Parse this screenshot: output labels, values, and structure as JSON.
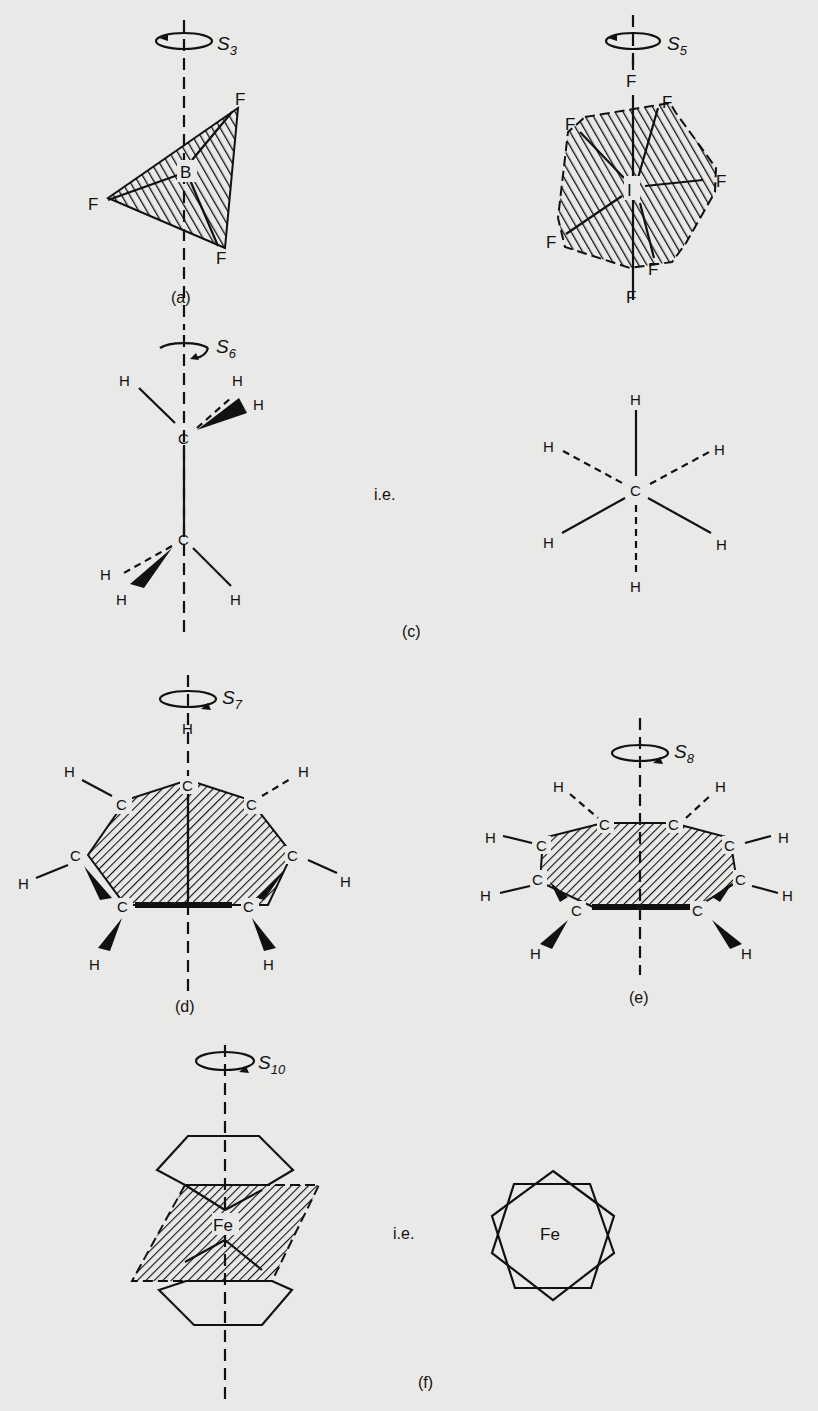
{
  "figure": {
    "panels": [
      {
        "id": "a",
        "caption": "(a)",
        "axis_symbol": "S",
        "axis_order": "3",
        "atoms": {
          "center": "B",
          "ligand": "F"
        },
        "ligand_labels": [
          "F",
          "F",
          "F"
        ]
      },
      {
        "id": "b",
        "caption": "",
        "axis_symbol": "S",
        "axis_order": "5",
        "atoms": {
          "center": "I",
          "ligand": "F"
        },
        "ligand_labels": [
          "F",
          "F",
          "F",
          "F",
          "F",
          "F",
          "F"
        ]
      },
      {
        "id": "c",
        "caption": "(c)",
        "axis_symbol": "S",
        "axis_order": "6",
        "atoms": {
          "carbon": "C",
          "hydrogen": "H"
        },
        "ie_label": "i.e.",
        "newman": {
          "center": "C",
          "hydrogens": [
            "H",
            "H",
            "H",
            "H",
            "H",
            "H"
          ]
        }
      },
      {
        "id": "d",
        "caption": "(d)",
        "axis_symbol": "S",
        "axis_order": "7",
        "atoms": {
          "carbon": "C",
          "hydrogen": "H"
        }
      },
      {
        "id": "e",
        "caption": "(e)",
        "axis_symbol": "S",
        "axis_order": "8",
        "atoms": {
          "carbon": "C",
          "hydrogen": "H"
        }
      },
      {
        "id": "f",
        "caption": "(f)",
        "axis_symbol": "S",
        "axis_order": "10",
        "atoms": {
          "metal": "Fe"
        },
        "ie_label": "i.e.",
        "top_view": {
          "center": "Fe"
        }
      }
    ]
  },
  "colors": {
    "paper": "#e9e9e7",
    "ink": "#111111",
    "show_through": "#cfcfcc"
  }
}
